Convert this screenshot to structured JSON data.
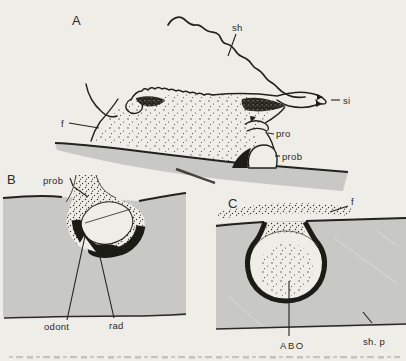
{
  "figure": {
    "colors": {
      "paper": "#eeede8",
      "substrate": "#c8c8c4",
      "ink": "#22221c",
      "dark_fill": "#1d1d18",
      "stipple": "#3b3b33"
    },
    "panels": {
      "a": {
        "letter": "A",
        "labels": {
          "sh": "sh",
          "si": "si",
          "f": "f",
          "pro": "pro",
          "prob": "prob"
        }
      },
      "b": {
        "letter": "B",
        "labels": {
          "prob": "prob",
          "odont": "odont",
          "rad": "rad"
        }
      },
      "c": {
        "letter": "C",
        "labels": {
          "f": "f",
          "abo": "ABO",
          "sh_p": "sh. p"
        }
      }
    }
  }
}
